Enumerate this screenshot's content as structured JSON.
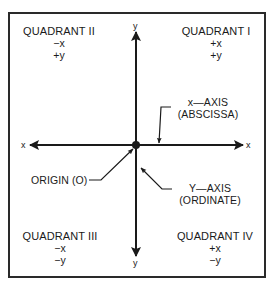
{
  "diagram": {
    "quadrants": [
      {
        "id": "I",
        "title": "QUADRANT I",
        "x_sign": "+x",
        "y_sign": "+y"
      },
      {
        "id": "II",
        "title": "QUADRANT II",
        "x_sign": "−x",
        "y_sign": "+y"
      },
      {
        "id": "III",
        "title": "QUADRANT III",
        "x_sign": "−x",
        "y_sign": "−y"
      },
      {
        "id": "IV",
        "title": "QUADRANT IV",
        "x_sign": "+x",
        "y_sign": "−y"
      }
    ],
    "axes": {
      "x_left_label": "x",
      "x_right_label": "x",
      "y_top_label": "y",
      "y_bottom_label": "y"
    },
    "callouts": {
      "x_axis": {
        "line1": "x—AXIS",
        "line2": "(ABSCISSA)"
      },
      "y_axis": {
        "line1": "Y—AXIS",
        "line2": "(ORDINATE)"
      },
      "origin": {
        "label": "ORIGIN (O)"
      }
    },
    "colors": {
      "ink": "#1a1a1a",
      "background": "#ffffff",
      "frame": "#2a2a2a"
    }
  }
}
